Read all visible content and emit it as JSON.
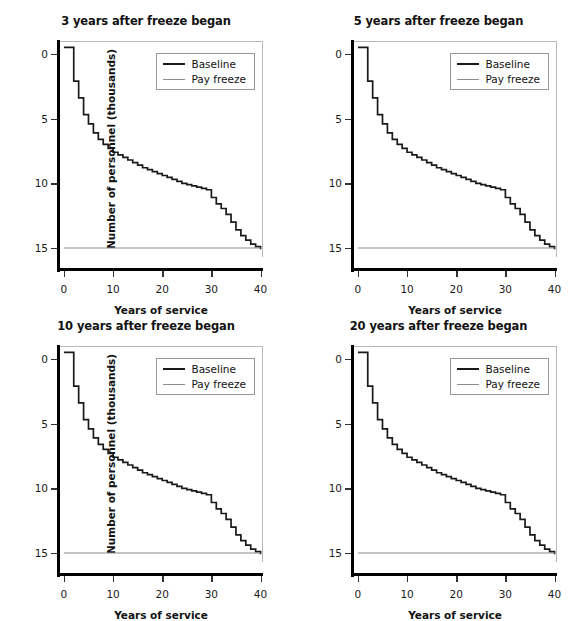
{
  "figure": {
    "panels": [
      {
        "title": "3 years after freeze began",
        "position": "top-left"
      },
      {
        "title": "5 years after freeze began",
        "position": "top-right"
      },
      {
        "title": "10 years after freeze began",
        "position": "bottom-left"
      },
      {
        "title": "20 years after freeze began",
        "position": "bottom-right"
      }
    ],
    "legend": {
      "baseline_label": "Baseline",
      "payfreeze_label": "Pay freeze"
    },
    "axes": {
      "xlabel": "Years of service",
      "ylabel": "Number of personnel (thousands)",
      "xticks": [
        "0",
        "10",
        "20",
        "30",
        "40"
      ],
      "yticks": [
        "0",
        "5",
        "10",
        "15"
      ]
    },
    "colors": {
      "baseline": "#1a1a1a",
      "payfreeze": "#8c8c8c",
      "frame": "#b8b8b8",
      "axis": "#000000",
      "background": "#ffffff"
    }
  },
  "chart_data": {
    "type": "line",
    "subplot_layout": "2x2",
    "xlabel": "Years of service",
    "ylabel": "Number of personnel (thousands)",
    "xlim": [
      -1,
      40.5
    ],
    "ylim": [
      -0.7,
      16.0
    ],
    "xticks": [
      0,
      10,
      20,
      30,
      40
    ],
    "yticks": [
      0,
      5,
      10,
      15
    ],
    "grid": false,
    "legend_position": "upper right",
    "step_style": "post",
    "x": [
      0,
      1,
      2,
      3,
      4,
      5,
      6,
      7,
      8,
      9,
      10,
      11,
      12,
      13,
      14,
      15,
      16,
      17,
      18,
      19,
      20,
      21,
      22,
      23,
      24,
      25,
      26,
      27,
      28,
      29,
      30,
      31,
      32,
      33,
      34,
      35,
      36,
      37,
      38,
      39,
      40
    ],
    "panels": [
      {
        "title": "3 years after freeze began",
        "series": [
          {
            "name": "Baseline",
            "color": "#1a1a1a",
            "values": [
              15.5,
              15.5,
              12.9,
              11.6,
              10.3,
              9.6,
              8.9,
              8.4,
              8.0,
              7.7,
              7.4,
              7.2,
              7.0,
              6.8,
              6.6,
              6.4,
              6.2,
              6.05,
              5.9,
              5.75,
              5.6,
              5.45,
              5.3,
              5.15,
              5.0,
              4.9,
              4.8,
              4.7,
              4.6,
              4.5,
              3.9,
              3.4,
              3.05,
              2.6,
              2.0,
              1.4,
              0.95,
              0.6,
              0.3,
              0.1,
              -0.1
            ]
          },
          {
            "name": "Pay freeze",
            "color": "#8c8c8c",
            "values": [
              0,
              0,
              0,
              0,
              0,
              0,
              0,
              0,
              0,
              0,
              0,
              0,
              0,
              0,
              0,
              0,
              0,
              0,
              0,
              0,
              0,
              0,
              0,
              0,
              0,
              0,
              0,
              0,
              0,
              0,
              0,
              0,
              0,
              0,
              0,
              0,
              0,
              0,
              0,
              0,
              0
            ]
          }
        ]
      },
      {
        "title": "5 years after freeze began",
        "series": [
          {
            "name": "Baseline",
            "color": "#1a1a1a",
            "values": [
              15.5,
              15.5,
              12.9,
              11.6,
              10.3,
              9.6,
              8.9,
              8.4,
              8.0,
              7.7,
              7.4,
              7.2,
              7.0,
              6.8,
              6.6,
              6.4,
              6.2,
              6.05,
              5.9,
              5.75,
              5.6,
              5.45,
              5.3,
              5.15,
              5.0,
              4.9,
              4.8,
              4.7,
              4.6,
              4.5,
              3.9,
              3.4,
              3.05,
              2.6,
              2.0,
              1.4,
              0.95,
              0.6,
              0.3,
              0.1,
              -0.1
            ]
          },
          {
            "name": "Pay freeze",
            "color": "#8c8c8c",
            "values": [
              0,
              0,
              0,
              0,
              0,
              0,
              0,
              0,
              0,
              0,
              0,
              0,
              0,
              0,
              0,
              0,
              0,
              0,
              0,
              0,
              0,
              0,
              0,
              0,
              0,
              0,
              0,
              0,
              0,
              0,
              0,
              0,
              0,
              0,
              0,
              0,
              0,
              0,
              0,
              0,
              0
            ]
          }
        ]
      },
      {
        "title": "10 years after freeze began",
        "series": [
          {
            "name": "Baseline",
            "color": "#1a1a1a",
            "values": [
              15.5,
              15.5,
              12.9,
              11.6,
              10.3,
              9.6,
              8.9,
              8.4,
              8.0,
              7.7,
              7.4,
              7.2,
              7.0,
              6.8,
              6.6,
              6.4,
              6.2,
              6.05,
              5.9,
              5.75,
              5.6,
              5.45,
              5.3,
              5.15,
              5.0,
              4.9,
              4.8,
              4.7,
              4.6,
              4.5,
              3.9,
              3.4,
              3.05,
              2.6,
              2.0,
              1.4,
              0.95,
              0.6,
              0.3,
              0.1,
              -0.1
            ]
          },
          {
            "name": "Pay freeze",
            "color": "#8c8c8c",
            "values": [
              0,
              0,
              0,
              0,
              0,
              0,
              0,
              0,
              0,
              0,
              0,
              0,
              0,
              0,
              0,
              0,
              0,
              0,
              0,
              0,
              0,
              0,
              0,
              0,
              0,
              0,
              0,
              0,
              0,
              0,
              0,
              0,
              0,
              0,
              0,
              0,
              0,
              0,
              0,
              0,
              0
            ]
          }
        ]
      },
      {
        "title": "20 years after freeze began",
        "series": [
          {
            "name": "Baseline",
            "color": "#1a1a1a",
            "values": [
              15.5,
              15.5,
              12.9,
              11.6,
              10.3,
              9.6,
              8.9,
              8.4,
              8.0,
              7.7,
              7.4,
              7.2,
              7.0,
              6.8,
              6.6,
              6.4,
              6.2,
              6.05,
              5.9,
              5.75,
              5.6,
              5.45,
              5.3,
              5.15,
              5.0,
              4.9,
              4.8,
              4.7,
              4.6,
              4.5,
              3.9,
              3.4,
              3.05,
              2.6,
              2.0,
              1.4,
              0.95,
              0.6,
              0.3,
              0.1,
              -0.1
            ]
          },
          {
            "name": "Pay freeze",
            "color": "#8c8c8c",
            "values": [
              0,
              0,
              0,
              0,
              0,
              0,
              0,
              0,
              0,
              0,
              0,
              0,
              0,
              0,
              0,
              0,
              0,
              0,
              0,
              0,
              0,
              0,
              0,
              0,
              0,
              0,
              0,
              0,
              0,
              0,
              0,
              0,
              0,
              0,
              0,
              0,
              0,
              0,
              0,
              0,
              0
            ]
          }
        ]
      }
    ]
  }
}
